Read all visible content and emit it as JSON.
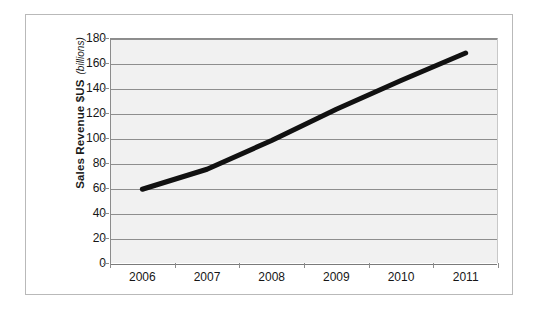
{
  "chart_data": {
    "type": "line",
    "title": "",
    "subtitle": "",
    "xlabel": "",
    "ylabel": "Sales Revenue $US",
    "ylabel_sub": "(billions)",
    "categories": [
      "2006",
      "2007",
      "2008",
      "2009",
      "2010",
      "2011"
    ],
    "x": [
      2006,
      2007,
      2008,
      2009,
      2010,
      2011
    ],
    "values": [
      59,
      75,
      98,
      123,
      146,
      168
    ],
    "series": [
      {
        "name": "Sales Revenue",
        "values": [
          59,
          75,
          98,
          123,
          146,
          168
        ],
        "color": "#111111",
        "line_width": 5
      }
    ],
    "ylim": [
      0,
      180
    ],
    "ytick_step": 20,
    "ytick_labels": [
      "0",
      "20",
      "40",
      "60",
      "80",
      "100",
      "120",
      "140",
      "160",
      "180"
    ],
    "ytick_values": [
      0,
      20,
      40,
      60,
      80,
      100,
      120,
      140,
      160,
      180
    ],
    "xtick_labels": [
      "2006",
      "2007",
      "2008",
      "2009",
      "2010",
      "2011"
    ],
    "grid": true,
    "grid_axis": "y",
    "legend": false,
    "legend_position": "none",
    "annotations": []
  },
  "style": {
    "plot_background": "#f1f1f1",
    "page_background": "#ffffff",
    "grid_color": "#8e8e8e",
    "axis_color": "#8c8c8c",
    "frame_border_color": "#b9b9b9",
    "text_color": "#161616",
    "series_color": "#111111"
  }
}
